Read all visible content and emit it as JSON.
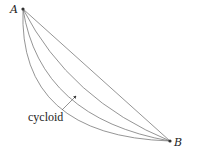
{
  "diagram": {
    "points": {
      "A": {
        "label": "A",
        "x": 23,
        "y": 9
      },
      "B": {
        "label": "B",
        "x": 170,
        "y": 141
      }
    },
    "curves": [
      {
        "name": "straight-line",
        "path": "M23,9 L170,141"
      },
      {
        "name": "shallow-arc",
        "path": "M23,9 Q70,100 170,141"
      },
      {
        "name": "cycloid",
        "path": "M23,9 Q40,118 170,141"
      },
      {
        "name": "deep-arc",
        "path": "M23,9 Q18,136 170,141"
      }
    ],
    "annotation": {
      "label": "cycloid",
      "arrow_from": {
        "x": 62,
        "y": 110
      },
      "arrow_to": {
        "x": 76,
        "y": 96
      }
    },
    "colors": {
      "curve": "#7a7a7a",
      "text": "#222222",
      "point": "#333333"
    }
  }
}
